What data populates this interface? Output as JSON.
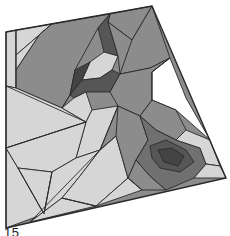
{
  "figure": {
    "caption_label": "15",
    "palette": {
      "light": "#d6d6d6",
      "mid": "#8c8c8c",
      "mid_dark": "#707070",
      "dark": "#565656",
      "darkest": "#444444",
      "stroke": "#2a2a2a",
      "background": "#ffffff"
    },
    "outline": [
      [
        6,
        32
      ],
      [
        152,
        6
      ],
      [
        226,
        178
      ],
      [
        6,
        228
      ]
    ],
    "regions": [
      {
        "name": "left-strip",
        "shade": "light",
        "points": [
          [
            6,
            32
          ],
          [
            16,
            30
          ],
          [
            16,
            88
          ],
          [
            6,
            86
          ]
        ]
      },
      {
        "name": "top-left-sliver",
        "shade": "light",
        "points": [
          [
            16,
            30
          ],
          [
            52,
            24
          ],
          [
            16,
            55
          ]
        ]
      },
      {
        "name": "top-left-sliver-2",
        "shade": "light",
        "points": [
          [
            52,
            24
          ],
          [
            40,
            34
          ],
          [
            16,
            70
          ],
          [
            16,
            55
          ]
        ]
      },
      {
        "name": "upper-big-mid",
        "shade": "mid",
        "points": [
          [
            16,
            70
          ],
          [
            40,
            34
          ],
          [
            52,
            24
          ],
          [
            110,
            14
          ],
          [
            98,
            28
          ],
          [
            75,
            70
          ],
          [
            70,
            95
          ],
          [
            62,
            108
          ],
          [
            16,
            88
          ]
        ]
      },
      {
        "name": "upper-mid-top",
        "shade": "mid",
        "points": [
          [
            110,
            14
          ],
          [
            152,
            6
          ],
          [
            132,
            40
          ],
          [
            108,
            22
          ]
        ]
      },
      {
        "name": "upper-dark-wedge",
        "shade": "dark",
        "points": [
          [
            98,
            28
          ],
          [
            110,
            14
          ],
          [
            108,
            22
          ],
          [
            118,
            56
          ],
          [
            104,
            52
          ]
        ]
      },
      {
        "name": "upper-light-pocket",
        "shade": "light",
        "points": [
          [
            104,
            52
          ],
          [
            118,
            56
          ],
          [
            112,
            70
          ],
          [
            100,
            78
          ],
          [
            82,
            80
          ],
          [
            90,
            62
          ]
        ]
      },
      {
        "name": "upper-dark-left",
        "shade": "darkest",
        "points": [
          [
            75,
            70
          ],
          [
            90,
            62
          ],
          [
            82,
            80
          ],
          [
            70,
            95
          ]
        ]
      },
      {
        "name": "center-dark-band",
        "shade": "dark",
        "points": [
          [
            70,
            95
          ],
          [
            82,
            80
          ],
          [
            100,
            78
          ],
          [
            112,
            70
          ],
          [
            120,
            74
          ],
          [
            110,
            92
          ],
          [
            86,
            92
          ],
          [
            74,
            98
          ]
        ]
      },
      {
        "name": "right-mid-big",
        "shade": "mid",
        "points": [
          [
            132,
            40
          ],
          [
            152,
            6
          ],
          [
            170,
            58
          ],
          [
            150,
            68
          ],
          [
            120,
            74
          ],
          [
            118,
            56
          ],
          [
            108,
            22
          ]
        ]
      },
      {
        "name": "right-mid-lower",
        "shade": "mid",
        "points": [
          [
            120,
            74
          ],
          [
            150,
            68
          ],
          [
            170,
            58
          ],
          [
            152,
            72
          ],
          [
            152,
            100
          ],
          [
            140,
            116
          ],
          [
            118,
            106
          ],
          [
            110,
            92
          ]
        ]
      },
      {
        "name": "white-notch",
        "shade": "background",
        "points": [
          [
            170,
            58
          ],
          [
            186,
            98
          ],
          [
            210,
            140
          ],
          [
            176,
            110
          ],
          [
            152,
            100
          ],
          [
            152,
            72
          ]
        ]
      },
      {
        "name": "right-edge-mid",
        "shade": "mid",
        "points": [
          [
            152,
            100
          ],
          [
            176,
            110
          ],
          [
            186,
            130
          ],
          [
            176,
            140
          ],
          [
            156,
            130
          ],
          [
            140,
            116
          ]
        ]
      },
      {
        "name": "lower-left-light-a",
        "shade": "light",
        "points": [
          [
            6,
            86
          ],
          [
            16,
            88
          ],
          [
            62,
            108
          ],
          [
            86,
            122
          ],
          [
            6,
            148
          ]
        ]
      },
      {
        "name": "lower-left-light-b",
        "shade": "light",
        "points": [
          [
            62,
            108
          ],
          [
            74,
            98
          ],
          [
            86,
            92
          ],
          [
            92,
            110
          ],
          [
            86,
            122
          ]
        ]
      },
      {
        "name": "center-light-band",
        "shade": "light",
        "points": [
          [
            86,
            122
          ],
          [
            92,
            110
          ],
          [
            118,
            106
          ],
          [
            100,
            150
          ],
          [
            76,
            158
          ]
        ]
      },
      {
        "name": "left-light-c",
        "shade": "light",
        "points": [
          [
            6,
            148
          ],
          [
            18,
            168
          ],
          [
            44,
            214
          ],
          [
            6,
            228
          ]
        ]
      },
      {
        "name": "left-light-d",
        "shade": "light",
        "points": [
          [
            6,
            148
          ],
          [
            86,
            122
          ],
          [
            76,
            158
          ],
          [
            52,
            172
          ],
          [
            18,
            168
          ]
        ]
      },
      {
        "name": "left-light-e",
        "shade": "light",
        "points": [
          [
            18,
            168
          ],
          [
            52,
            172
          ],
          [
            44,
            214
          ]
        ]
      },
      {
        "name": "bottom-light-f",
        "shade": "light",
        "points": [
          [
            44,
            214
          ],
          [
            52,
            172
          ],
          [
            76,
            158
          ],
          [
            100,
            150
          ],
          [
            80,
            176
          ],
          [
            62,
            198
          ],
          [
            30,
            222
          ]
        ]
      },
      {
        "name": "bottom-light-g",
        "shade": "light",
        "points": [
          [
            30,
            222
          ],
          [
            62,
            198
          ],
          [
            96,
            206
          ]
        ]
      },
      {
        "name": "bottom-light-h",
        "shade": "light",
        "points": [
          [
            62,
            198
          ],
          [
            80,
            176
          ],
          [
            100,
            150
          ],
          [
            116,
            136
          ],
          [
            128,
            178
          ],
          [
            96,
            206
          ]
        ]
      },
      {
        "name": "bottom-light-i",
        "shade": "light",
        "points": [
          [
            96,
            206
          ],
          [
            128,
            178
          ],
          [
            142,
            190
          ]
        ]
      },
      {
        "name": "center-mid-strip",
        "shade": "mid",
        "points": [
          [
            116,
            136
          ],
          [
            118,
            106
          ],
          [
            140,
            116
          ],
          [
            148,
            140
          ],
          [
            136,
            160
          ],
          [
            128,
            178
          ]
        ]
      },
      {
        "name": "lower-right-mid",
        "shade": "mid",
        "points": [
          [
            128,
            178
          ],
          [
            136,
            160
          ],
          [
            150,
            176
          ],
          [
            166,
            190
          ],
          [
            142,
            190
          ]
        ]
      },
      {
        "name": "eye-outer",
        "shade": "mid_dark",
        "points": [
          [
            140,
            116
          ],
          [
            156,
            130
          ],
          [
            176,
            140
          ],
          [
            200,
            148
          ],
          [
            206,
            164
          ],
          [
            194,
            178
          ],
          [
            166,
            190
          ],
          [
            150,
            176
          ],
          [
            136,
            160
          ],
          [
            148,
            140
          ]
        ]
      },
      {
        "name": "eye-inner",
        "shade": "dark",
        "points": [
          [
            150,
            146
          ],
          [
            166,
            140
          ],
          [
            186,
            150
          ],
          [
            194,
            162
          ],
          [
            180,
            172
          ],
          [
            160,
            168
          ],
          [
            152,
            158
          ]
        ]
      },
      {
        "name": "eye-core",
        "shade": "darkest",
        "points": [
          [
            158,
            150
          ],
          [
            172,
            148
          ],
          [
            184,
            156
          ],
          [
            178,
            166
          ],
          [
            164,
            162
          ]
        ]
      },
      {
        "name": "right-light-edge",
        "shade": "light",
        "points": [
          [
            176,
            140
          ],
          [
            186,
            130
          ],
          [
            210,
            140
          ],
          [
            220,
            166
          ],
          [
            206,
            164
          ],
          [
            200,
            148
          ]
        ]
      },
      {
        "name": "bottom-right-light",
        "shade": "light",
        "points": [
          [
            194,
            178
          ],
          [
            206,
            164
          ],
          [
            220,
            166
          ],
          [
            226,
            178
          ]
        ]
      }
    ],
    "lines": [
      [
        [
          16,
          30
        ],
        [
          16,
          88
        ]
      ],
      [
        [
          6,
          86
        ],
        [
          86,
          122
        ]
      ],
      [
        [
          6,
          148
        ],
        [
          86,
          122
        ]
      ],
      [
        [
          18,
          168
        ],
        [
          44,
          214
        ]
      ],
      [
        [
          52,
          172
        ],
        [
          44,
          214
        ]
      ],
      [
        [
          30,
          222
        ],
        [
          100,
          150
        ]
      ],
      [
        [
          62,
          198
        ],
        [
          96,
          206
        ]
      ],
      [
        [
          100,
          150
        ],
        [
          116,
          136
        ]
      ],
      [
        [
          118,
          106
        ],
        [
          100,
          150
        ]
      ],
      [
        [
          128,
          178
        ],
        [
          142,
          190
        ]
      ],
      [
        [
          70,
          95
        ],
        [
          62,
          108
        ]
      ],
      [
        [
          132,
          40
        ],
        [
          120,
          74
        ]
      ],
      [
        [
          152,
          72
        ],
        [
          152,
          100
        ]
      ],
      [
        [
          170,
          58
        ],
        [
          152,
          72
        ]
      ]
    ]
  }
}
